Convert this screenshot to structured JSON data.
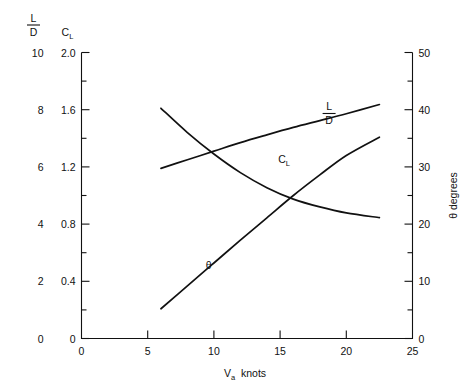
{
  "chart_data": {
    "type": "line",
    "title": "",
    "xlabel": "V_a  knots",
    "xlabel_main": "V",
    "xlabel_sub": "a",
    "xlabel_tail": "knots",
    "xlim": [
      0,
      25
    ],
    "x_ticks": [
      0,
      5,
      10,
      15,
      20,
      25
    ],
    "x_tick_labels": [
      "0",
      "5",
      "10",
      "15",
      "20",
      "25"
    ],
    "grid": false,
    "legend": "inline-curve-labels",
    "axes": [
      {
        "id": "left-outer",
        "name": "L/D",
        "label_numerator": "L",
        "label_denominator": "D",
        "position": "left-outer",
        "lim": [
          0,
          10
        ],
        "ticks": [
          0,
          2,
          4,
          6,
          8,
          10
        ],
        "tick_labels": [
          "0",
          "2",
          "4",
          "6",
          "8",
          "10"
        ]
      },
      {
        "id": "left-inner",
        "name": "C_L",
        "label_main": "C",
        "label_sub": "L",
        "position": "left-inner",
        "lim": [
          0,
          2.0
        ],
        "ticks": [
          0,
          0.4,
          0.8,
          1.2,
          1.6,
          2.0
        ],
        "tick_labels": [
          "0",
          "0.4",
          "0.8",
          "1.2",
          "1.6",
          "2.0"
        ],
        "minor_ticks": [
          0.2,
          0.6,
          1.0,
          1.4,
          1.8
        ]
      },
      {
        "id": "right",
        "name": "θ degrees",
        "position": "right",
        "lim": [
          0,
          50
        ],
        "ticks": [
          0,
          10,
          20,
          30,
          40,
          50
        ],
        "tick_labels": [
          "0",
          "10",
          "20",
          "30",
          "40",
          "50"
        ],
        "minor_ticks": [
          5,
          15,
          25,
          35,
          45
        ]
      }
    ],
    "series": [
      {
        "name": "L/D",
        "label": "L/D",
        "label_numerator": "L",
        "label_denominator": "D",
        "axis": "left-outer",
        "label_x": 18.7,
        "label_y": 7.85,
        "x": [
          6.0,
          8.0,
          10.0,
          12.0,
          14.0,
          16.0,
          18.0,
          20.0,
          22.5
        ],
        "y": [
          5.95,
          6.25,
          6.55,
          6.85,
          7.12,
          7.38,
          7.62,
          7.86,
          8.18
        ]
      },
      {
        "name": "C_L",
        "label": "C_L",
        "label_main": "C",
        "label_sub": "L",
        "axis": "left-inner",
        "label_x": 15.3,
        "label_y": 1.23,
        "x": [
          6.0,
          8.0,
          10.0,
          12.0,
          14.0,
          16.0,
          18.0,
          20.0,
          22.5
        ],
        "y": [
          1.61,
          1.44,
          1.29,
          1.16,
          1.055,
          0.975,
          0.92,
          0.878,
          0.845
        ]
      },
      {
        "name": "theta",
        "label": "θ",
        "axis": "right",
        "label_x": 9.6,
        "label_y": 12.2,
        "x": [
          6.0,
          8.0,
          10.0,
          12.0,
          14.0,
          16.0,
          18.0,
          20.0,
          22.5
        ],
        "y": [
          5.2,
          9.2,
          13.2,
          17.2,
          21.1,
          25.0,
          28.6,
          32.0,
          35.2
        ]
      }
    ],
    "colors": {
      "curve": "#111111",
      "axis": "#111111",
      "background": "#ffffff"
    }
  }
}
